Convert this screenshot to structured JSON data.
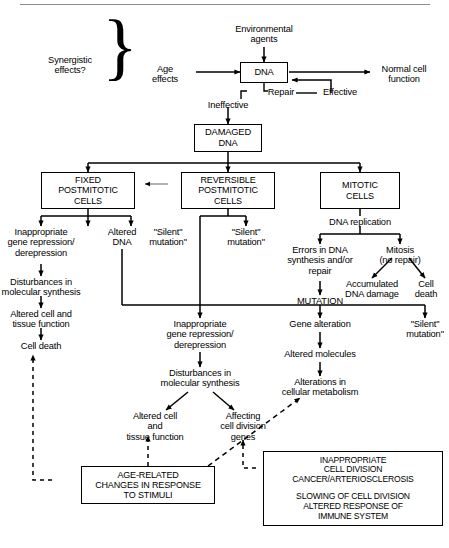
{
  "figure": {
    "type": "flowchart",
    "rule_color": "#8d8d8d",
    "line_color": "#000000",
    "background": "#ffffff"
  },
  "nodes": {
    "synergistic_effects": "Synergistic\neffects?",
    "environmental_agents": "Environmental\nagents",
    "age_effects": "Age\neffects",
    "dna": "DNA",
    "normal_cell_function": "Normal cell\nfunction",
    "repair": "Repair",
    "effective": "Effective",
    "ineffective": "Ineffective",
    "damaged_dna": "DAMAGED\nDNA",
    "fixed_postmitotic_cells": "FIXED\nPOSTMITOTIC\nCELLS",
    "reversible_postmitotic_cells": "REVERSIBLE\nPOSTMITOTIC\nCELLS",
    "mitotic_cells": "MITOTIC\nCELLS",
    "inappropriate_gene_repression_left": "Inappropriate\ngene repression/\nderepression",
    "altered_dna": "Altered\nDNA",
    "silent_mutation_left": "\"Silent\"\nmutation\"",
    "silent_mutation_mid": "\"Silent\"\nmutation\"",
    "dna_replication": "DNA replication",
    "errors_in_dna": "Errors in DNA\nsynthesis and/or\nrepair",
    "mitosis_no_repair": "Mitosis\n(no repair)",
    "accumulated_dna_damage": "Accumulated\nDNA damage",
    "cell_death_right": "Cell\ndeath",
    "mutation": "MUTATION",
    "disturbances_left": "Disturbances in\nmolecular synthesis",
    "altered_cell_tissue_left": "Altered cell and\ntissue function",
    "cell_death_left": "Cell death",
    "inappropriate_gene_repression_mid": "Inappropriate\ngene repression/\nderepression",
    "disturbances_mid": "Disturbances in\nmolecular synthesis",
    "altered_cell_and_tissue": "Altered cell\nand\ntissue function",
    "affecting_cell_division_genes": "Affecting\ncell division\ngenes",
    "gene_alteration": "Gene alteration",
    "altered_molecules": "Altered molecules",
    "alterations_cellular_metabolism": "Alterations in\ncellular metabolism",
    "silent_mutation_right": "\"Silent\"\nmutation\"",
    "age_related_changes": "AGE-RELATED\nCHANGES IN RESPONSE\nTO STIMULI",
    "outcome_upper": "INAPPROPRIATE\nCELL DIVISION\nCANCER/ARTERIOSCLEROSIS",
    "outcome_lower": "SLOWING OF CELL DIVISION\nALTERED RESPONSE OF\nIMMUNE SYSTEM"
  },
  "braces": {
    "synergistic_brace": "}"
  }
}
